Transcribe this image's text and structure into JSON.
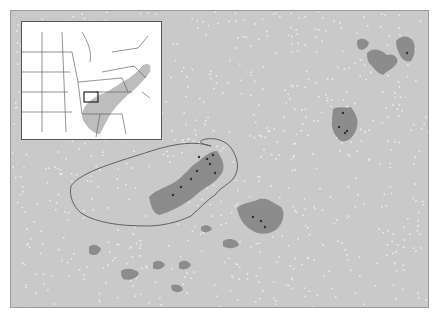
{
  "map": {
    "colors": {
      "background": "#c9c9c9",
      "patch": "#8c8c8c",
      "speckle": "#ececec",
      "outline": "#555555",
      "site": "#333333"
    },
    "study_area_outline": "M70,185 C80,170 120,160 150,150 C175,142 195,140 210,145 C200,143 195,140 205,138 C218,136 228,142 232,150 C238,160 238,170 232,178 C225,185 218,188 215,193 C205,200 198,208 190,215 C175,222 160,225 145,225 C120,225 95,222 80,212 C72,205 68,195 70,185 Z",
    "patches": [
      {
        "name": "central-cluster",
        "d": "M148,196 C155,188 170,185 178,178 C185,172 190,165 198,160 C203,155 210,150 216,150 C220,156 224,162 222,170 C218,178 212,182 206,186 C198,190 192,198 184,202 C175,208 165,212 158,214 C152,212 150,206 148,196 Z"
      },
      {
        "name": "east-cluster",
        "d": "M236,207 C244,200 252,202 258,198 C266,196 272,202 280,206 C285,212 282,222 276,228 C268,234 258,234 252,230 C244,226 238,218 236,207 Z"
      },
      {
        "name": "ne-cluster-a",
        "d": "M332,108 C338,104 344,108 350,106 C354,112 358,118 356,126 C354,134 348,142 340,140 C334,136 330,128 331,120 C331,115 332,111 332,108 Z"
      },
      {
        "name": "ne-cluster-b",
        "d": "M366,52 C372,46 380,48 386,54 C392,52 398,56 396,62 C392,68 386,70 382,74 C376,72 372,66 368,62 C366,58 366,55 366,52 Z"
      },
      {
        "name": "ne-cluster-c",
        "d": "M395,40 C400,34 408,34 412,40 C415,46 414,54 410,60 C405,62 400,58 398,52 C396,48 395,44 395,40 Z"
      },
      {
        "name": "ne-cluster-d",
        "d": "M356,40 C360,36 366,38 368,42 C366,48 362,50 358,48 C356,46 356,43 356,40 Z"
      },
      {
        "name": "south-small-a",
        "d": "M88,246 C92,242 98,244 100,248 C98,254 92,256 88,252 Z"
      },
      {
        "name": "south-small-b",
        "d": "M120,270 C126,266 134,268 138,272 C136,278 128,280 122,278 C120,275 120,272 120,270 Z"
      },
      {
        "name": "south-small-c",
        "d": "M152,262 C156,258 162,260 164,264 C162,268 156,270 152,267 Z"
      },
      {
        "name": "south-small-d",
        "d": "M178,262 C182,258 188,260 190,264 C188,268 182,270 178,267 Z"
      },
      {
        "name": "south-small-e",
        "d": "M170,285 C174,282 180,284 182,288 C180,292 174,292 171,289 Z"
      },
      {
        "name": "mid-small-a",
        "d": "M222,240 C228,236 236,238 238,244 C234,248 226,248 222,245 Z"
      },
      {
        "name": "mid-small-b",
        "d": "M200,226 C204,223 209,224 211,228 C208,232 202,232 200,229 Z"
      }
    ],
    "sites": [
      [
        198,
        156
      ],
      [
        206,
        158
      ],
      [
        212,
        154
      ],
      [
        209,
        163
      ],
      [
        196,
        170
      ],
      [
        190,
        178
      ],
      [
        180,
        186
      ],
      [
        172,
        194
      ],
      [
        214,
        172
      ],
      [
        252,
        216
      ],
      [
        260,
        220
      ],
      [
        264,
        226
      ],
      [
        342,
        112
      ],
      [
        338,
        126
      ],
      [
        346,
        130
      ],
      [
        344,
        132
      ],
      [
        406,
        52
      ]
    ]
  },
  "inset": {
    "colors": {
      "background": "#ffffff",
      "state_line": "#666666",
      "range": "#bdbdbd",
      "box": "#222222"
    },
    "range_shape": "M60,92 C62,82 70,76 80,72 C90,68 96,62 104,58 C110,54 116,50 120,44 C126,40 130,42 128,50 C124,56 118,62 112,68 C104,74 96,82 90,90 C86,96 82,104 78,112 C72,112 66,106 62,100 C60,97 60,94 60,92 Z",
    "focus_box": {
      "x": 62,
      "y": 70,
      "w": 14,
      "h": 10
    },
    "state_lines": [
      "M0,30 L50,30",
      "M0,50 L48,50",
      "M0,70 L46,70",
      "M0,90 L50,90",
      "M20,10 L20,110",
      "M40,10 L44,110",
      "M50,30 L56,60 L60,92",
      "M60,92 L100,92",
      "M74,70 L110,70",
      "M80,50 L112,44",
      "M90,30 L116,26",
      "M100,92 L104,112",
      "M78,92 L74,115",
      "M112,44 L124,56",
      "M116,26 L126,14",
      "M56,60 L100,56",
      "M60,10 C66,20 70,30 68,40",
      "M100,56 L106,70",
      "M120,70 L128,76"
    ]
  }
}
